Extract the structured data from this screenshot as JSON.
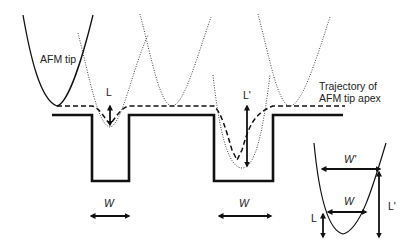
{
  "figure": {
    "labels": {
      "afm_tip": "AFM tip",
      "trajectory_line1": "Trajectory of",
      "trajectory_line2": "AFM tip apex",
      "L": "L",
      "L_prime": "L'",
      "W_left": "W",
      "W_right": "W",
      "inset_W_prime": "W'",
      "inset_W": "W",
      "inset_L": "L",
      "inset_L_prime": "L'"
    },
    "colors": {
      "line": "#111111",
      "dotted": "#444444"
    }
  }
}
